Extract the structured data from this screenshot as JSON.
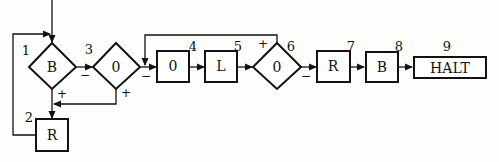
{
  "diagram": {
    "nodes": [
      {
        "id": "1",
        "shape": "diamond",
        "label": "B",
        "number": "1"
      },
      {
        "id": "2",
        "shape": "box",
        "label": "R",
        "number": "2"
      },
      {
        "id": "3",
        "shape": "diamond",
        "label": "0",
        "number": "3"
      },
      {
        "id": "4",
        "shape": "box",
        "label": "0",
        "number": "4"
      },
      {
        "id": "5",
        "shape": "box",
        "label": "L",
        "number": "5"
      },
      {
        "id": "6",
        "shape": "diamond",
        "label": "0",
        "number": "6"
      },
      {
        "id": "7",
        "shape": "box",
        "label": "R",
        "number": "7"
      },
      {
        "id": "8",
        "shape": "box",
        "label": "B",
        "number": "8"
      },
      {
        "id": "9",
        "shape": "box",
        "label": "HALT",
        "number": "9"
      }
    ],
    "signs": {
      "n1_minus": "−",
      "n1_plus": "+",
      "n3_minus": "−",
      "n3_plus": "+",
      "n6_plus": "+",
      "n6_minus": "−"
    },
    "edges": [
      {
        "from": "start",
        "to": "1"
      },
      {
        "from": "1",
        "to": "3",
        "label": "−"
      },
      {
        "from": "1",
        "to": "2",
        "label": "+"
      },
      {
        "from": "3",
        "to": "4",
        "label": "−"
      },
      {
        "from": "3",
        "to": "2",
        "label": "+"
      },
      {
        "from": "2",
        "to": "1"
      },
      {
        "from": "4",
        "to": "5"
      },
      {
        "from": "5",
        "to": "6"
      },
      {
        "from": "6",
        "to": "4",
        "label": "+"
      },
      {
        "from": "6",
        "to": "7",
        "label": "−"
      },
      {
        "from": "7",
        "to": "8"
      },
      {
        "from": "8",
        "to": "9"
      }
    ]
  }
}
